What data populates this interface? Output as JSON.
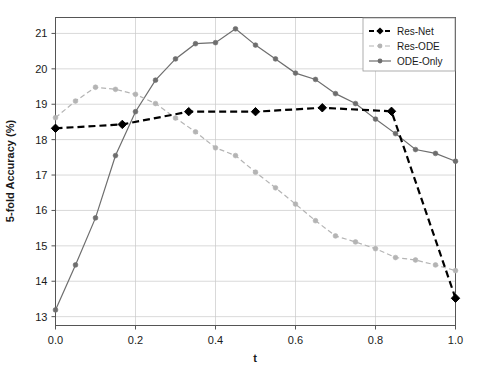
{
  "chart_data": {
    "type": "line",
    "title": "",
    "xlabel": "t",
    "ylabel": "5-fold Accuracy (%)",
    "xlim": [
      0.0,
      1.0
    ],
    "ylim": [
      12.75,
      21.45
    ],
    "xticks": [
      "0.0",
      "0.2",
      "0.4",
      "0.6",
      "0.8",
      "1.0"
    ],
    "xtick_values": [
      0.0,
      0.2,
      0.4,
      0.6,
      0.8,
      1.0
    ],
    "yticks": [
      "13",
      "14",
      "15",
      "16",
      "17",
      "18",
      "19",
      "20",
      "21"
    ],
    "ytick_values": [
      13,
      14,
      15,
      16,
      17,
      18,
      19,
      20,
      21
    ],
    "grid": true,
    "legend_position": "top-right",
    "series": [
      {
        "name": "Res-Net",
        "color": "#000000",
        "marker": "diamond",
        "linestyle": "dashed",
        "x": [
          0.0,
          0.167,
          0.333,
          0.5,
          0.667,
          0.84,
          1.0
        ],
        "values": [
          18.32,
          18.43,
          18.79,
          18.79,
          18.9,
          18.8,
          13.52
        ]
      },
      {
        "name": "Res-ODE",
        "color": "#b4b4b4",
        "marker": "circle",
        "linestyle": "dashed",
        "x": [
          0.0,
          0.05,
          0.1,
          0.15,
          0.2,
          0.25,
          0.3,
          0.35,
          0.4,
          0.45,
          0.5,
          0.55,
          0.6,
          0.65,
          0.7,
          0.75,
          0.8,
          0.85,
          0.9,
          0.95,
          1.0
        ],
        "values": [
          18.62,
          19.09,
          19.48,
          19.42,
          19.28,
          19.02,
          18.61,
          18.22,
          17.77,
          17.55,
          17.08,
          16.64,
          16.18,
          15.71,
          15.28,
          15.11,
          14.92,
          14.67,
          14.6,
          14.46,
          14.3
        ]
      },
      {
        "name": "ODE-Only",
        "color": "#6e6e6e",
        "marker": "circle",
        "linestyle": "solid",
        "x": [
          0.0,
          0.05,
          0.1,
          0.15,
          0.2,
          0.25,
          0.3,
          0.35,
          0.4,
          0.45,
          0.5,
          0.55,
          0.6,
          0.65,
          0.7,
          0.75,
          0.8,
          0.85,
          0.9,
          0.95,
          1.0
        ],
        "values": [
          13.19,
          14.46,
          15.79,
          17.55,
          18.79,
          19.68,
          20.28,
          20.71,
          20.74,
          21.13,
          20.67,
          20.28,
          19.88,
          19.7,
          19.3,
          19.02,
          18.58,
          18.17,
          17.72,
          17.61,
          17.39
        ]
      }
    ]
  },
  "legend": {
    "entries": [
      {
        "label": "Res-Net"
      },
      {
        "label": "Res-ODE"
      },
      {
        "label": "ODE-Only"
      }
    ]
  },
  "colors": {
    "res_net": "#000000",
    "res_ode": "#b4b4b4",
    "ode_only": "#6e6e6e",
    "grid": "#c8c8c8",
    "axis": "#555555",
    "background": "#ffffff"
  }
}
